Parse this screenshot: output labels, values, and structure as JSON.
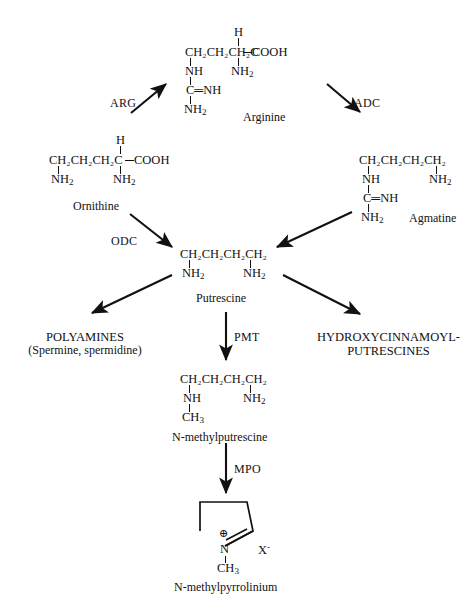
{
  "figure": {
    "type": "biosynthetic-pathway-diagram",
    "background": "#ffffff",
    "ink": "#111111"
  },
  "compounds": {
    "arginine": {
      "name": "Arginine",
      "top_atom": "H",
      "backbone": "CH2CH2CH2C—COOH",
      "chain_label": "CH₂CH₂CH₂C",
      "acid_group": "COOH",
      "alpha_amino": "NH2",
      "side_nh": "NH",
      "side_cnh": "C═NH",
      "side_nh2": "NH2"
    },
    "ornithine": {
      "name": "Ornithine",
      "top_atom": "H",
      "chain_label": "CH₂CH₂CH₂C",
      "acid_group": "COOH",
      "terminal_amino": "NH2",
      "alpha_amino": "NH2"
    },
    "agmatine": {
      "name": "Agmatine",
      "chain_label": "CH₂CH₂CH₂CH₂",
      "terminal_amino": "NH2",
      "side_nh": "NH",
      "side_cnh": "C═NH",
      "side_nh2": "NH2"
    },
    "putrescine": {
      "name": "Putrescine",
      "chain_label": "CH₂CH₂CH₂CH₂",
      "left_amino": "NH2",
      "right_amino": "NH2"
    },
    "n_methylputrescine": {
      "name": "N-methylputrescine",
      "chain_label": "CH₂CH₂CH₂CH₂",
      "left_nh": "NH",
      "methyl": "CH3",
      "right_amino": "NH2"
    },
    "n_methylpyrrolinium": {
      "name": "N-methylpyrrolinium",
      "charge_symbol": "⊕",
      "nitrogen": "N",
      "methyl": "CH3",
      "counterion": "X",
      "counterion_charge": "-"
    }
  },
  "enzymes": [
    {
      "id": "arg",
      "label": "ARG",
      "from": "ornithine",
      "to": "arginine"
    },
    {
      "id": "adc",
      "label": "ADC",
      "from": "arginine",
      "to": "agmatine"
    },
    {
      "id": "odc",
      "label": "ODC",
      "from": "ornithine",
      "to": "putrescine"
    },
    {
      "id": "pmt",
      "label": "PMT",
      "from": "putrescine",
      "to": "n_methylputrescine"
    },
    {
      "id": "mpo",
      "label": "MPO",
      "from": "n_methylputrescine",
      "to": "n_methylpyrrolinium"
    }
  ],
  "products": {
    "polyamines": {
      "line1": "POLYAMINES",
      "line2": "(Spermine, spermidine)"
    },
    "hydroxycinnamoyl": {
      "line1": "HYDROXYCINNAMOYL-",
      "line2": "PUTRESCINES"
    }
  },
  "unlabeled_steps": [
    {
      "from": "agmatine",
      "to": "putrescine"
    },
    {
      "from": "putrescine",
      "to": "polyamines"
    },
    {
      "from": "putrescine",
      "to": "hydroxycinnamoyl"
    }
  ]
}
